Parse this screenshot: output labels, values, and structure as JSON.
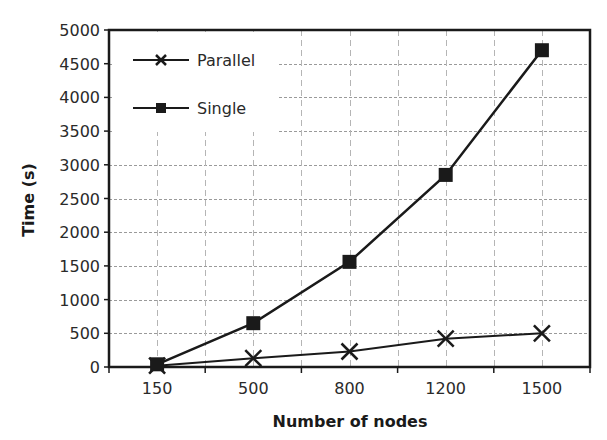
{
  "chart_data": {
    "type": "line",
    "title": "",
    "xlabel": "Number of nodes",
    "ylabel": "Time (s)",
    "categories": [
      "150",
      "500",
      "800",
      "1200",
      "1500"
    ],
    "series": [
      {
        "name": "Parallel",
        "marker": "x",
        "values": [
          20,
          130,
          230,
          420,
          500
        ]
      },
      {
        "name": "Single",
        "marker": "square",
        "values": [
          40,
          650,
          1560,
          2850,
          4700
        ]
      }
    ],
    "ylim": [
      0,
      5000
    ],
    "yticks": [
      0,
      500,
      1000,
      1500,
      2000,
      2500,
      3000,
      3500,
      4000,
      4500,
      5000
    ],
    "grid": true,
    "legend_position": "upper-left-inside"
  },
  "colors": {
    "line": "#1a1a1a",
    "grid": "#9a9a9a",
    "axis": "#1a1a1a",
    "background": "#ffffff"
  }
}
